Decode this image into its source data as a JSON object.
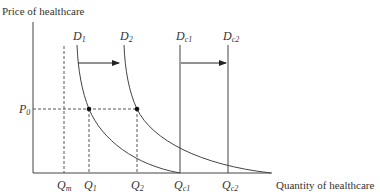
{
  "figure": {
    "y_axis_label": "Price of healthcare",
    "x_axis_label": "Quantity of healthcare",
    "price_label": {
      "main": "P",
      "sub": "0"
    },
    "curves": [
      {
        "id": "D1",
        "main": "D",
        "sub": "1",
        "type": "demand-curve"
      },
      {
        "id": "D2",
        "main": "D",
        "sub": "2",
        "type": "demand-curve"
      },
      {
        "id": "Dc1",
        "main": "D",
        "sub": "c1",
        "type": "vertical-demand"
      },
      {
        "id": "Dc2",
        "main": "D",
        "sub": "c2",
        "type": "vertical-demand"
      }
    ],
    "quantity_labels": [
      {
        "id": "Qm",
        "main": "Q",
        "sub": "m"
      },
      {
        "id": "Q1",
        "main": "Q",
        "sub": "1"
      },
      {
        "id": "Q2",
        "main": "Q",
        "sub": "2"
      },
      {
        "id": "Qc1",
        "main": "Q",
        "sub": "c1"
      },
      {
        "id": "Qc2",
        "main": "Q",
        "sub": "c2"
      }
    ],
    "shifts": [
      {
        "from": "D1",
        "to": "D2"
      },
      {
        "from": "Dc1",
        "to": "Dc2"
      }
    ],
    "colors": {
      "line": "#444444",
      "text": "#333333",
      "background": "#ffffff"
    }
  }
}
